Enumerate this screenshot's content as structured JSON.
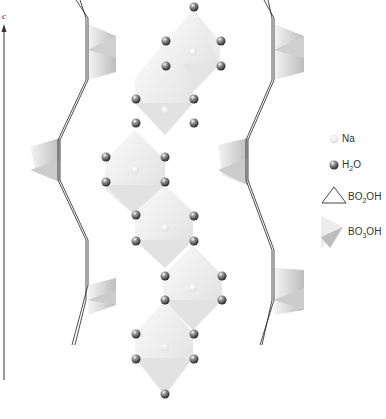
{
  "figure": {
    "type": "crystal-structure-diagram",
    "axis": {
      "label": "c",
      "direction": "up"
    },
    "legend": [
      {
        "id": "na",
        "label": "Na",
        "symbol": "small-white-sphere"
      },
      {
        "id": "h2o",
        "label_main": "H",
        "label_sub": "2",
        "label_tail": "O",
        "symbol": "dark-grey-sphere"
      },
      {
        "id": "bo2oh",
        "label_main": "BO",
        "label_sub": "2",
        "label_tail": "OH",
        "symbol": "triangle-outline"
      },
      {
        "id": "bo3oh",
        "label_main": "BO",
        "label_sub": "3",
        "label_tail": "OH",
        "symbol": "shaded-tetrahedron"
      }
    ],
    "colors": {
      "polyhedron_light": "#f2f2f2",
      "polyhedron_mid": "#e2e2e2",
      "polyhedron_dark": "#c8c8c8",
      "sphere_dark": "#555555",
      "sphere_na": "#f4f4f4",
      "line": "#222222"
    }
  }
}
